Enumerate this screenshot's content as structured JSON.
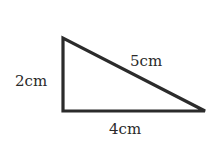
{
  "diagram": {
    "shape": "right triangle",
    "sides": {
      "vertical": "2cm",
      "hypotenuse": "5cm",
      "base": "4cm"
    },
    "colors": {
      "stroke": "#2b2b2b",
      "text": "#2a2a2a",
      "background": "#ffffff"
    }
  }
}
